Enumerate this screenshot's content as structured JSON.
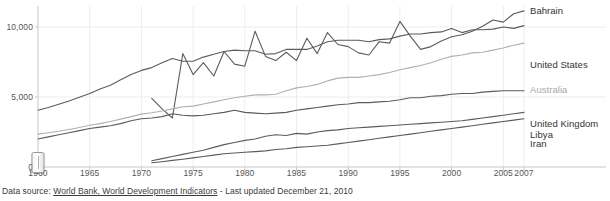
{
  "footer": {
    "prefix": "Data source:",
    "link_text": "World Bank, World Development Indicators",
    "suffix": "- Last updated December 21, 2010"
  },
  "slider": {
    "name": "range-slider-left-handle",
    "position_year": 1960
  },
  "axes": {
    "y_ticks": [
      "0",
      "5,000",
      "10,000"
    ],
    "y_values": [
      0,
      5000,
      10000
    ],
    "x_ticks": [
      "1960",
      "1965",
      "1970",
      "1975",
      "1980",
      "1985",
      "1990",
      "1995",
      "2000",
      "2005",
      "2007"
    ],
    "x_values": [
      1960,
      1965,
      1970,
      1975,
      1980,
      1985,
      1990,
      1995,
      2000,
      2005,
      2007
    ]
  },
  "colors": {
    "line_dark": "#5b5b5b",
    "line_light": "#b0b0b0",
    "gridline": "#ededed",
    "axis": "#c8c8c8",
    "label_dark": "#333333",
    "label_light": "#a8a8a8",
    "text": "#555555"
  },
  "chart_data": {
    "type": "line",
    "title": "",
    "subtitle": "",
    "xlabel": "",
    "ylabel": "",
    "xlim": [
      1960,
      2007
    ],
    "ylim": [
      0,
      11500
    ],
    "grid": true,
    "legend_position": "right-inline",
    "x": [
      1960,
      1961,
      1962,
      1963,
      1964,
      1965,
      1966,
      1967,
      1968,
      1969,
      1970,
      1971,
      1972,
      1973,
      1974,
      1975,
      1976,
      1977,
      1978,
      1979,
      1980,
      1981,
      1982,
      1983,
      1984,
      1985,
      1986,
      1987,
      1988,
      1989,
      1990,
      1991,
      1992,
      1993,
      1994,
      1995,
      1996,
      1997,
      1998,
      1999,
      2000,
      2001,
      2002,
      2003,
      2004,
      2005,
      2006,
      2007
    ],
    "series": [
      {
        "name": "Bahrain",
        "color": "#5b5b5b",
        "label_y_value": 11200,
        "values": [
          null,
          null,
          null,
          null,
          null,
          null,
          null,
          null,
          null,
          null,
          null,
          4900,
          4150,
          3500,
          8100,
          6600,
          7450,
          6500,
          8250,
          7350,
          7200,
          9700,
          7900,
          7600,
          8200,
          7600,
          9200,
          8100,
          9600,
          8750,
          8600,
          8150,
          8000,
          8950,
          8850,
          10400,
          9350,
          8400,
          8600,
          9000,
          9300,
          9450,
          9700,
          10050,
          10500,
          10350,
          10950,
          11150
        ]
      },
      {
        "name": "United States",
        "color": "#5b5b5b",
        "label_y_value": 7350,
        "values": [
          4050,
          4250,
          4480,
          4720,
          4980,
          5250,
          5570,
          5840,
          6230,
          6600,
          6900,
          7100,
          7450,
          7750,
          7550,
          7550,
          7850,
          8050,
          8250,
          8350,
          8300,
          8300,
          8050,
          8100,
          8400,
          8400,
          8400,
          8650,
          8950,
          9050,
          9050,
          9050,
          8950,
          9100,
          9150,
          9350,
          9500,
          9500,
          9600,
          9650,
          9900,
          9600,
          9800,
          9800,
          9850,
          10000,
          9900,
          10100
        ]
      },
      {
        "name": "Australia",
        "color": "#b0b0b0",
        "label_y_value": 5600,
        "values": [
          2350,
          2450,
          2550,
          2680,
          2820,
          2980,
          3100,
          3250,
          3420,
          3600,
          3780,
          3880,
          4000,
          4150,
          4300,
          4350,
          4500,
          4650,
          4800,
          4950,
          5050,
          5150,
          5150,
          5200,
          5450,
          5650,
          5750,
          5900,
          6150,
          6350,
          6400,
          6400,
          6500,
          6600,
          6750,
          6950,
          7100,
          7250,
          7450,
          7700,
          7900,
          8000,
          8150,
          8200,
          8350,
          8500,
          8700,
          8850
        ]
      },
      {
        "name": "United Kingdom",
        "color": "#5b5b5b",
        "label_y_value": 3150,
        "values": [
          2000,
          2150,
          2300,
          2450,
          2600,
          2750,
          2850,
          2950,
          3100,
          3300,
          3450,
          3500,
          3600,
          3800,
          3700,
          3650,
          3700,
          3800,
          3900,
          4050,
          3900,
          3850,
          3800,
          3850,
          3900,
          4050,
          4150,
          4250,
          4350,
          4450,
          4500,
          4600,
          4600,
          4650,
          4700,
          4800,
          4950,
          4950,
          5050,
          5100,
          5200,
          5250,
          5250,
          5350,
          5400,
          5450,
          5450,
          5450
        ]
      },
      {
        "name": "Libya",
        "color": "#5b5b5b",
        "label_y_value": 2350,
        "values": [
          null,
          null,
          null,
          null,
          null,
          null,
          null,
          null,
          null,
          null,
          null,
          450,
          600,
          750,
          900,
          1050,
          1200,
          1400,
          1600,
          1750,
          1900,
          2000,
          2200,
          2300,
          2250,
          2400,
          2350,
          2500,
          2600,
          2650,
          2750,
          2800,
          2850,
          2900,
          2950,
          3000,
          3050,
          3100,
          3150,
          3200,
          3250,
          3300,
          3400,
          3500,
          3600,
          3700,
          3800,
          3900
        ]
      },
      {
        "name": "Iran",
        "color": "#5b5b5b",
        "label_y_value": 1700,
        "values": [
          null,
          null,
          null,
          null,
          null,
          null,
          null,
          null,
          null,
          null,
          null,
          300,
          380,
          470,
          560,
          650,
          750,
          850,
          950,
          1000,
          1050,
          1100,
          1150,
          1250,
          1300,
          1400,
          1450,
          1500,
          1550,
          1650,
          1750,
          1850,
          1950,
          2050,
          2150,
          2250,
          2350,
          2450,
          2550,
          2650,
          2750,
          2850,
          2950,
          3050,
          3150,
          3250,
          3350,
          3450
        ]
      }
    ]
  }
}
